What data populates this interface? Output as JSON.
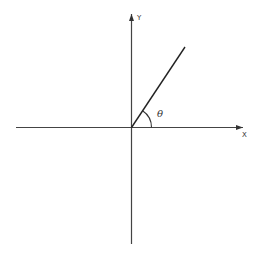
{
  "diagram": {
    "type": "angle-on-cartesian-axes",
    "x_axis_label": "X",
    "y_axis_label": "Y",
    "angle_label": "θ",
    "colors": {
      "axis": "#444444",
      "ray": "#222222",
      "label": "#333333",
      "background": "#ffffff"
    }
  }
}
